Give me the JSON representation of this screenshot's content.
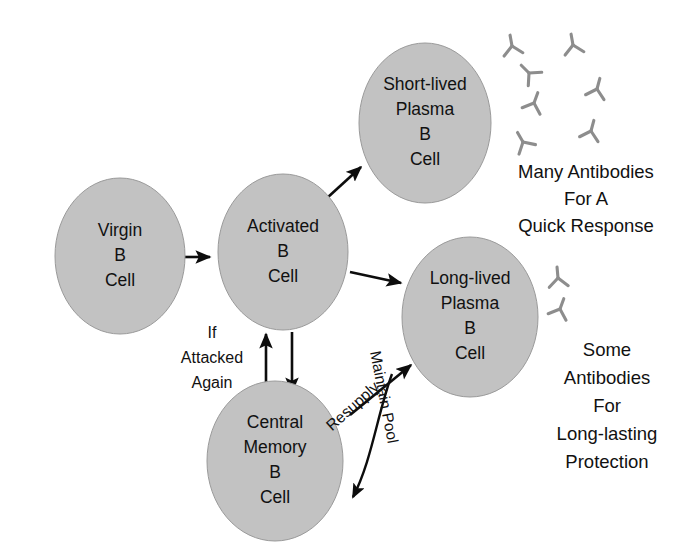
{
  "figure": {
    "type": "flow-diagram",
    "background_color": "#ffffff",
    "cell_fill_color": "#c2c2c2",
    "cell_stroke_color": "#9a9a9a",
    "arrow_color": "#0d0d0d",
    "antibody_color": "#8d8d8d",
    "text_color": "#111111"
  },
  "cells": [
    {
      "id": "virgin",
      "name": "virgin-b-cell",
      "lines": [
        "Virgin",
        "B",
        "Cell"
      ],
      "cx": 120,
      "cy": 256,
      "rx": 65,
      "ry": 78
    },
    {
      "id": "activated",
      "name": "activated-b-cell",
      "lines": [
        "Activated",
        "B",
        "Cell"
      ],
      "cx": 283,
      "cy": 252,
      "rx": 65,
      "ry": 78
    },
    {
      "id": "short_lived",
      "name": "short-lived-plasma-b-cell",
      "lines": [
        "Short-lived",
        "Plasma",
        "B",
        "Cell"
      ],
      "cx": 425,
      "cy": 123,
      "rx": 66,
      "ry": 80
    },
    {
      "id": "long_lived",
      "name": "long-lived-plasma-b-cell",
      "lines": [
        "Long-lived",
        "Plasma",
        "B",
        "Cell"
      ],
      "cx": 470,
      "cy": 317,
      "rx": 68,
      "ry": 80
    },
    {
      "id": "central_memory",
      "name": "central-memory-b-cell",
      "lines": [
        "Central",
        "Memory",
        "B",
        "Cell"
      ],
      "cx": 275,
      "cy": 461,
      "rx": 68,
      "ry": 80
    }
  ],
  "arrows": [
    {
      "id": "virgin_to_activated",
      "name": "arrow-virgin-to-activated",
      "from": "virgin",
      "to": "activated",
      "path": "M 182 257 L 210 257",
      "label": ""
    },
    {
      "id": "activated_to_short_lived",
      "name": "arrow-activated-to-short-lived",
      "from": "activated",
      "to": "short_lived",
      "path": "M 327 198 L 361 167",
      "label": ""
    },
    {
      "id": "activated_to_long_lived",
      "name": "arrow-activated-to-long-lived",
      "from": "activated",
      "to": "long_lived",
      "path": "M 350 272 L 401 283",
      "label": ""
    },
    {
      "id": "memory_to_activated",
      "name": "arrow-memory-to-activated",
      "from": "central_memory",
      "to": "activated",
      "path": "M 266 394 L 266 334",
      "label": "If Attacked Again"
    },
    {
      "id": "activated_to_memory",
      "name": "arrow-activated-to-memory",
      "from": "activated",
      "to": "central_memory",
      "path": "M 292 332 L 292 392",
      "label": ""
    },
    {
      "id": "resupply",
      "name": "arrow-resupply",
      "from": "central_memory",
      "to": "long_lived",
      "path": "M 350 415 L 411 365",
      "label": "Resupply"
    },
    {
      "id": "maintain_pool",
      "name": "arrow-maintain-pool",
      "from": "long_lived",
      "to": "central_memory",
      "path": "M 392 374 C 377 415 372 460 353 497",
      "label": "Maintain Pool"
    }
  ],
  "edge_labels": {
    "if_attacked_again": {
      "name": "label-if-attacked-again",
      "lines": [
        "If",
        "Attacked",
        "Again"
      ],
      "x": 212,
      "y": 334
    },
    "resupply": {
      "name": "label-resupply",
      "text": "Resupply",
      "x": 356,
      "y": 410,
      "rotation": -42
    },
    "maintain_pool": {
      "name": "label-maintain-pool",
      "text": "Maintain Pool",
      "x": 379,
      "y": 398,
      "rotation": 79
    }
  },
  "captions": [
    {
      "id": "many_antibodies",
      "name": "caption-many-antibodies",
      "lines": [
        "Many Antibodies",
        "For A",
        "Quick Response"
      ],
      "x": 586,
      "y": 173,
      "line_height": 27
    },
    {
      "id": "some_antibodies",
      "name": "caption-some-antibodies",
      "lines": [
        "Some",
        "Antibodies",
        "For",
        "Long-lasting",
        "Protection"
      ],
      "x": 607,
      "y": 351,
      "line_height": 28
    }
  ],
  "antibody_groups": [
    {
      "id": "many_group",
      "name": "antibody-cluster-many",
      "count": 7,
      "items": [
        {
          "x": 512,
          "y": 46,
          "rotation": 170
        },
        {
          "x": 573,
          "y": 45,
          "rotation": 170
        },
        {
          "x": 529,
          "y": 73,
          "rotation": 135
        },
        {
          "x": 597,
          "y": 89,
          "rotation": 195
        },
        {
          "x": 534,
          "y": 103,
          "rotation": 200
        },
        {
          "x": 591,
          "y": 131,
          "rotation": 195
        },
        {
          "x": 523,
          "y": 142,
          "rotation": 150
        }
      ]
    },
    {
      "id": "some_group",
      "name": "antibody-cluster-some",
      "count": 2,
      "items": [
        {
          "x": 558,
          "y": 278,
          "rotation": 175
        },
        {
          "x": 560,
          "y": 309,
          "rotation": 200
        }
      ]
    }
  ]
}
